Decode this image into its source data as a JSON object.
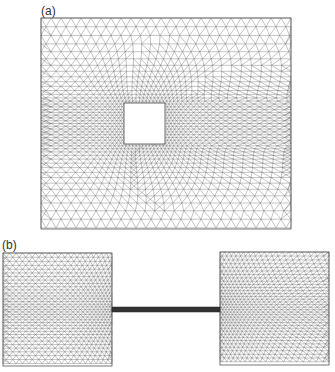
{
  "figure": {
    "panels": [
      {
        "label": "(a)",
        "label_pos": [
          41,
          4
        ],
        "description": "Rectangular domain with central square hole, triangular mesh refined around hole",
        "domain": {
          "x": 41,
          "y": 18,
          "w": 250,
          "h": 211
        },
        "hole": {
          "x": 124,
          "y": 103,
          "w": 41,
          "h": 41
        },
        "coarse_spacing": 10,
        "fine_spacing": 3.2
      },
      {
        "label": "(b)",
        "label_pos": [
          2,
          238
        ],
        "description": "Two square blocks connected by a thin bar, triangular mesh refined near the bar junctions",
        "left_block": {
          "x": 3,
          "y": 253,
          "w": 109,
          "h": 113
        },
        "right_block": {
          "x": 220,
          "y": 252,
          "w": 109,
          "h": 113
        },
        "bar": {
          "x": 112,
          "y": 307,
          "w": 108,
          "h": 5
        },
        "coarse_spacing": 6.5,
        "fine_spacing": 2.8
      }
    ],
    "colors": {
      "line": "#555555",
      "bar": "#333333",
      "background": "#ffffff"
    }
  }
}
